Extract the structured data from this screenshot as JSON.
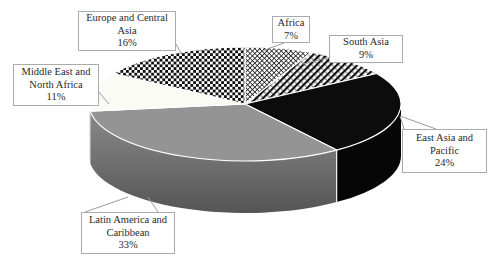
{
  "chart_data": {
    "type": "pie",
    "style": "3d",
    "title": "",
    "direction": "clockwise",
    "start_angle_deg": 0,
    "legend_position": "callout-labels",
    "slices": [
      {
        "id": "africa",
        "label": "Africa",
        "value": 7,
        "pct": "7%",
        "fill": "crosshatch"
      },
      {
        "id": "south-asia",
        "label": "South Asia",
        "value": 9,
        "pct": "9%",
        "fill": "diagonal-stripes"
      },
      {
        "id": "east-asia-pacific",
        "label": "East Asia and Pacific",
        "value": 24,
        "pct": "24%",
        "fill": "solid-black"
      },
      {
        "id": "latin-america-caribbean",
        "label": "Latin America and Caribbean",
        "value": 33,
        "pct": "33%",
        "fill": "solid-gray"
      },
      {
        "id": "middle-east-north-africa",
        "label": "Middle East and North Africa",
        "value": 11,
        "pct": "11%",
        "fill": "solid-white"
      },
      {
        "id": "europe-central-asia",
        "label": "Europe and Central Asia",
        "value": 16,
        "pct": "16%",
        "fill": "checkerboard"
      }
    ],
    "colors": {
      "black": "#0c0c0c",
      "black_side": "#060606",
      "gray": "#949494",
      "gray_side_top": "#8a8a8a",
      "gray_side_bottom": "#555555",
      "white_slice": "#fbfbf5",
      "white_slice_side": "#e8e8e0",
      "pattern_ink": "#111111",
      "background": "#ffffff",
      "label_border": "#ababab",
      "leader_line": "#9b9b9b",
      "text": "#2a2a2a",
      "separator": "#ffffff"
    }
  }
}
